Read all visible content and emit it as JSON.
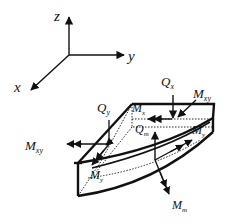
{
  "diagram": {
    "type": "plate element force/moment diagram",
    "axes": {
      "z": "z",
      "y": "y",
      "x": "x"
    },
    "labels": {
      "Qx": {
        "main": "Q",
        "sub": "x"
      },
      "Mxy_top": {
        "main": "M",
        "sub": "xy"
      },
      "Qy": {
        "main": "Q",
        "sub": "y"
      },
      "Mx": {
        "main": "M",
        "sub": "x"
      },
      "Qm": {
        "main": "Q",
        "sub": "m"
      },
      "Mxy_left": {
        "main": "M",
        "sub": "xy"
      },
      "Mxy_right": {
        "main": "M",
        "sub": "y"
      },
      "My": {
        "main": "M",
        "sub": "y"
      },
      "Mm": {
        "main": "M",
        "sub": "m"
      }
    },
    "colors": {
      "stroke": "#111111",
      "background": "#ffffff"
    }
  }
}
